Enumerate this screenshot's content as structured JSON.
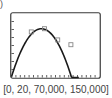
{
  "figure": {
    "part_label": ")",
    "window_label": "[0, 20, 70,000, 150,000]"
  },
  "chart_data": {
    "type": "scatter",
    "title": "",
    "xlabel": "",
    "ylabel": "",
    "xlim": [
      0,
      20
    ],
    "ylim": [
      70000,
      150000
    ],
    "xscale_tick": 1,
    "yscale_tick": 10000,
    "grid": false,
    "legend": null,
    "series": [
      {
        "name": "data points",
        "kind": "scatter",
        "marker": "square",
        "points": [
          {
            "x": 4.5,
            "y": 127000
          },
          {
            "x": 7.5,
            "y": 131000
          },
          {
            "x": 10.5,
            "y": 117000
          },
          {
            "x": 13.5,
            "y": 111000
          }
        ]
      },
      {
        "name": "quadratic regression",
        "kind": "line",
        "model": "y = a(x - h)^2 + k",
        "params": {
          "a": -1300,
          "h": 6.8,
          "k": 131000
        },
        "x_range": [
          0,
          15.3
        ]
      }
    ],
    "window": "[0, 20, 70,000, 150,000]"
  },
  "colors": {
    "frame": "#3a3a3a",
    "curve": "#1a1a1a",
    "marker": "#888888",
    "text": "#444444"
  }
}
